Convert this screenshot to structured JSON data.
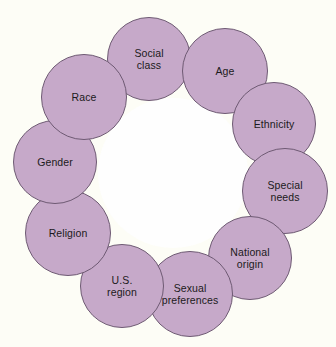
{
  "diagram": {
    "type": "circular-cluster",
    "background_color": "#fdfdf6",
    "node_fill_color": "#c6a9c9",
    "node_border_color": "#6e5a73",
    "label_color": "#1b1a20",
    "node_diameter": 84,
    "center": {
      "x": 173,
      "y": 173
    },
    "ring_radius": 103,
    "nodes": [
      {
        "id": "social-class",
        "label": "Social\nclass",
        "x": 149,
        "y": 59,
        "size": 84,
        "order": 1
      },
      {
        "id": "age",
        "label": "Age",
        "x": 225,
        "y": 71,
        "size": 86,
        "order": 2
      },
      {
        "id": "ethnicity",
        "label": "Ethnicity",
        "x": 274,
        "y": 124,
        "size": 84,
        "order": 3
      },
      {
        "id": "special-needs",
        "label": "Special\nneeds",
        "x": 285,
        "y": 191,
        "size": 86,
        "order": 4
      },
      {
        "id": "national-origin",
        "label": "National\norigin",
        "x": 250,
        "y": 258,
        "size": 84,
        "order": 5
      },
      {
        "id": "sexual-preferences",
        "label": "Sexual\npreferences",
        "x": 190,
        "y": 294,
        "size": 86,
        "order": 6
      },
      {
        "id": "us-region",
        "label": "U.S.\nregion",
        "x": 122,
        "y": 286,
        "size": 84,
        "order": 7
      },
      {
        "id": "religion",
        "label": "Religion",
        "x": 68,
        "y": 233,
        "size": 86,
        "order": 8
      },
      {
        "id": "gender",
        "label": "Gender",
        "x": 55,
        "y": 162,
        "size": 84,
        "order": 9
      },
      {
        "id": "race",
        "label": "Race",
        "x": 84,
        "y": 97,
        "size": 86,
        "order": 10
      }
    ]
  }
}
